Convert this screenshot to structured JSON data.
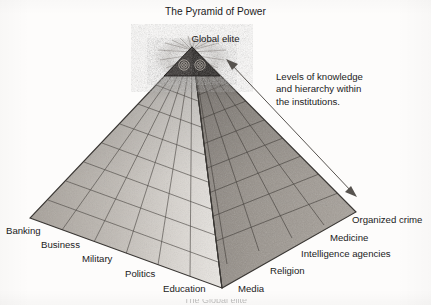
{
  "title": "The Pyramid of Power",
  "apex": {
    "label": "Global elite",
    "icon": "all-seeing-eye-capstone-icon"
  },
  "annotation": {
    "lines": [
      "Levels of knowledge",
      "and hierarchy within",
      "the institutions."
    ],
    "arrow": "double-headed-arrow-icon"
  },
  "left_face_labels": [
    {
      "text": "Banking"
    },
    {
      "text": "Business"
    },
    {
      "text": "Military"
    },
    {
      "text": "Politics"
    },
    {
      "text": "Education"
    }
  ],
  "right_face_labels": [
    {
      "text": "Media"
    },
    {
      "text": "Religion"
    },
    {
      "text": "Intelligence agencies"
    },
    {
      "text": "Medicine"
    },
    {
      "text": "Organized crime"
    }
  ],
  "bottom_cropped_text": "The Global elite",
  "colors": {
    "background": "#fdfcfb",
    "text": "#1b1b1b",
    "left_face": "#b9b4ae",
    "right_face": "#a09a94",
    "front_ridge_light": "#e8e5e0",
    "capstone": "#2f2c2a",
    "grid_line": "#4a4744",
    "outline": "#3c3936",
    "arrow": "#55514e"
  },
  "geometry": {
    "apex": [
      192,
      47
    ],
    "left_corner": [
      30,
      218
    ],
    "right_corner": [
      356,
      212
    ],
    "front_corner": [
      222,
      288
    ],
    "rows": 9,
    "columns_per_face": 6
  }
}
